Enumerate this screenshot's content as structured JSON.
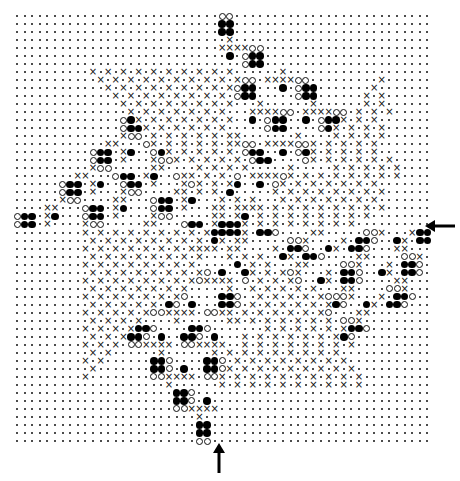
{
  "figure": {
    "grid": {
      "origin_x": 17,
      "origin_y": 16,
      "col_spacing": 7.6,
      "row_spacing": 8.5,
      "columns": 55,
      "rows": 51,
      "legend": {
        ".": "empty point",
        "x": "cross",
        "o": "open circle",
        "#": "filled circle"
      }
    },
    "cells": [
      "...........................oo..........................",
      "...........................##..........................",
      "...........................##..........................",
      "............................x..........................",
      "...........................xxxxoo......................",
      "............................#.o##......................",
      "..............................o##......................",
      "..........x.x.x.x.x.x.x.x.x.x......x...................",
      "...........x.x.x.x.x.x.x.x.x.xoo.xxxxoo.........x......",
      "............x.x.x.x.x.x.x.x.xo##...#.o##.......x.......",
      ".............x.x.x.x.x.x.x.x.o##.....o##......x.x......",
      "..............x.x.x.x.x.x.x.x...x......x......x.x......",
      "...............x.x.x.x.x.x.x...xxxxoo.xxxxoo.x.x.x.....",
      "..............o#x.x.x.x.x.x.x..#.o##..#.o##x.x.x.......",
      "..............o##x.x.x.x.x.x.....o##....o#x.x.x.x......",
      "..............xoo.x.x.x.x.x.xx.......x....x.x.x.x......",
      "............xx...ox.x.x.x.x.xxoo.xxxxoox.x.x.x.x.......",
      "..........o##.x#..o#x.x.x.x.x.o##..#.o#x.x.x.x.x.......",
      "..........o##.x...xoox.x.x.x.x.o##....ox.x.x.x.x.x.....",
      "..........xoo.....xx....x.x.x.x.....x.....x.x.x.x.x....",
      "........xx...o##.x#..oxx.x.x.o.xxxxox.x.x.x.x.x.x.x....",
      "......o##.x#..o##.x...xox.x.x#..#.ox.x.x.x.x.x.x.......",
      "......o##.x...xoo....xx.x.x.#.....x.x.x.x.x.x.x.x......",
      "......xoo....xx...o##.x#...x.x.x...x.x.x.x.x.x.x.......",
      "....xx...o##.x#...o##.x...xx.xxxx.x.x.x.x.x.x.x.x......",
      "o##.x#...o##.x....xoo.....xx.x#.x.x.x.x.x.x.x.x........",
      "o##.x....xoo.....xx...o##.x###x.x.x.x.x.x.x.x..........",
      ".........x.x.x.x.x.x.x.x.x####x.##o....xx.....oox...x##o",
      "..........x.x.x.x.x.x.x.x.#x.xx.....oox....x.##o..#x.##o",
      ".........x.x.x.x.x.x.x.xxxx.xx....x.##o..#x.##o...xx...",
      "..........x.x.x.x.x.x.x.x...x.x.x..#x.##o....xx....oox.",
      ".........x.x.x.x.x.x.x.x.....#.x.x...xx....oox...x.##o.",
      "..........x.x.x.x.x.x.x.xo.#..#x.x.xox...x.##o..#x.##o.",
      ".........x.x.x.x.x.x.x.xoxxxx.o.x.x.xo..#x.##o....xx...",
      "..........x.x.x.x.x.x.x.....x..x.x.x.x.x...xx....oox...",
      ".........x.x.x.x.x.x.xo....##o..x.x.x.x.xooox...x.##o..",
      "..........x.x.x.x.x.#o.#...##o.x.x.x.x.x.x#o..#x.##o...",
      ".........x.x.x.x.xooxxxx.ooxx.x.x.x.x.x.xo...xx........",
      "..........x.x.x.x....x......xx.x.x.x.x.x.x.oox.........",
      ".........x.x.x.x##o....##o.......x.x.x.x.x.x##o........",
      "..........x.x.x##o.#..##o.#...x.x.x.x.x.x.x#o..........",
      ".........x.x.x.ooxxxx.ooxxxx..x.x.x.x.x.x.x.x..........",
      "..........x.x......x......x.x.x.x.x.x.x.x.x............",
      ".........x.x......##o....##o.x.x.x.x.x.x.x.x...........",
      "..........x.......##o.#..##ox.x.x.x.x.x.x.x.x..........",
      ".........x........ooxxxx.oox.x.x.x.x.x.x.x.x.x.........",
      "....................x......x.x.x.x.x.x.x.x.x.x.........",
      ".....................##o...............................",
      ".....................##o.#.............................",
      ".....................ooxxxx............................",
      "........................x..............................",
      "........................##.............................",
      "........................##.............................",
      "........................oo............................."
    ],
    "arrows": [
      {
        "name": "right-arrow",
        "direction": "left",
        "x": 428,
        "y": 226
      },
      {
        "name": "bottom-arrow",
        "direction": "up",
        "x": 219,
        "y": 462
      }
    ]
  }
}
